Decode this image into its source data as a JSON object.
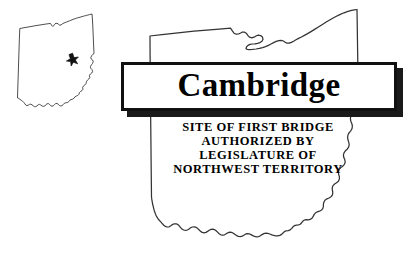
{
  "sign": {
    "banner": {
      "title": "Cambridge",
      "shadow_color": "#1a1a1a",
      "border_color": "#111111",
      "fill_color": "#ffffff"
    },
    "subtitle": {
      "lines": [
        "SITE OF FIRST BRIDGE",
        "AUTHORIZED BY",
        "LEGISLATURE OF",
        "NORTHWEST TERRITORY"
      ]
    }
  },
  "inset_map": {
    "name": "ohio-state-outline-inset",
    "marker": {
      "icon": "star-icon",
      "label": "Cambridge location marker"
    },
    "outline_color": "#3a3a3a"
  },
  "main_map": {
    "name": "ohio-state-outline-large",
    "outline_color": "#333333"
  },
  "page": {
    "background_color": "#ffffff",
    "ink_color": "#000000"
  }
}
